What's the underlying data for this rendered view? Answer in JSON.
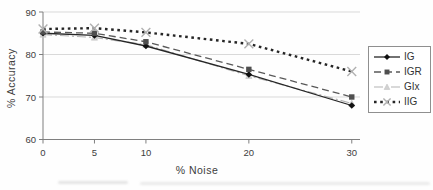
{
  "chart_data": {
    "type": "line",
    "title": "",
    "xlabel": "% Noise",
    "ylabel": "% Accuracy",
    "x": [
      0,
      5,
      10,
      20,
      30
    ],
    "xticks": [
      0,
      5,
      10,
      20,
      30
    ],
    "yticks": [
      60,
      70,
      80,
      90
    ],
    "xlim": [
      0,
      30.8
    ],
    "ylim": [
      60,
      90
    ],
    "grid": "horizontal",
    "legend_position": "right",
    "series": [
      {
        "name": "IG",
        "line": "solid",
        "marker": "diamond",
        "color": "#262626",
        "marker_color": "#111111",
        "values": [
          85.0,
          84.5,
          82.0,
          75.3,
          68.0
        ]
      },
      {
        "name": "IGR",
        "line": "dashed",
        "marker": "square",
        "color": "#595959",
        "marker_color": "#4f4f4f",
        "values": [
          85.3,
          85.0,
          83.0,
          76.5,
          70.0
        ]
      },
      {
        "name": "GIx",
        "line": "dashdot",
        "marker": "triangle",
        "color": "#b3b3b3",
        "marker_color": "#d2d2d2",
        "values": [
          84.7,
          84.0,
          82.3,
          75.0,
          68.5
        ]
      },
      {
        "name": "IIG",
        "line": "bold-dotted",
        "marker": "x-cross",
        "color": "#262626",
        "marker_color": "#b0b0b0",
        "values": [
          86.0,
          86.2,
          85.2,
          82.5,
          76.0
        ]
      }
    ],
    "colors": {
      "gridline": "#d9d9d9",
      "axis": "#7f7f7f",
      "tick_text": "#3d3d3d",
      "background": "#fefefe",
      "legend_border": "#8f8f8f"
    }
  }
}
